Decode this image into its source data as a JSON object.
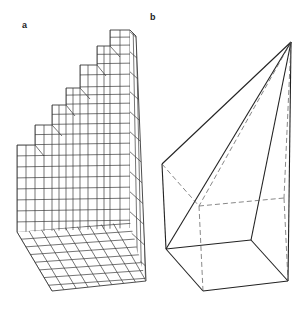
{
  "figure": {
    "panels": [
      {
        "label": "a",
        "description": "stepped voxel staircase"
      },
      {
        "label": "b",
        "description": "pyramid-like polyhedron with hidden dashed edges"
      }
    ],
    "colors": {
      "line": "#333333",
      "background": "#ffffff"
    }
  }
}
